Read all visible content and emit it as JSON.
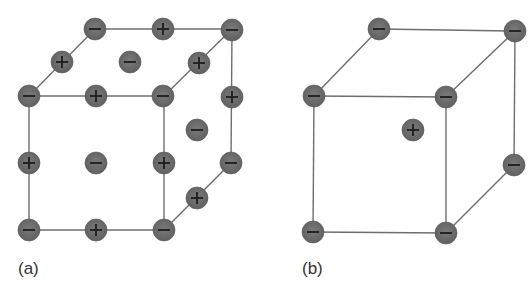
{
  "figure": {
    "panels": [
      {
        "id": "a",
        "label": "(a)",
        "description": "Rock-salt (NaCl-type) cubic unit cell with alternating cations and anions",
        "ions": [
          {
            "position": "top-back-left corner",
            "charge": "-"
          },
          {
            "position": "top-back edge midpoint",
            "charge": "+"
          },
          {
            "position": "top-back-right corner",
            "charge": "-"
          },
          {
            "position": "top-left edge midpoint",
            "charge": "+"
          },
          {
            "position": "top face center",
            "charge": "-"
          },
          {
            "position": "top-right edge midpoint",
            "charge": "+"
          },
          {
            "position": "top-front-left corner",
            "charge": "-"
          },
          {
            "position": "top-front edge midpoint",
            "charge": "+"
          },
          {
            "position": "top-front-right corner",
            "charge": "-"
          },
          {
            "position": "back-right vertical edge midpoint",
            "charge": "+"
          },
          {
            "position": "right face center",
            "charge": "-"
          },
          {
            "position": "front-left vertical edge midpoint",
            "charge": "+"
          },
          {
            "position": "front face center",
            "charge": "-"
          },
          {
            "position": "front-right vertical edge midpoint",
            "charge": "+"
          },
          {
            "position": "bottom-back-right corner",
            "charge": "-"
          },
          {
            "position": "bottom-right edge midpoint",
            "charge": "+"
          },
          {
            "position": "bottom-front-left corner",
            "charge": "-"
          },
          {
            "position": "bottom-front edge midpoint",
            "charge": "+"
          },
          {
            "position": "bottom-front-right corner",
            "charge": "-"
          }
        ]
      },
      {
        "id": "b",
        "label": "(b)",
        "description": "Cesium chloride (CsCl-type) cubic unit cell with body-centered cation",
        "ions": [
          {
            "position": "top-back-left corner",
            "charge": "-"
          },
          {
            "position": "top-back-right corner",
            "charge": "-"
          },
          {
            "position": "top-front-left corner",
            "charge": "-"
          },
          {
            "position": "top-front-right corner",
            "charge": "-"
          },
          {
            "position": "body center",
            "charge": "+"
          },
          {
            "position": "bottom-back-right corner",
            "charge": "-"
          },
          {
            "position": "bottom-front-left corner",
            "charge": "-"
          },
          {
            "position": "bottom-front-right corner",
            "charge": "-"
          }
        ]
      }
    ],
    "colors": {
      "ion_fill": "#6a6a6a",
      "sign": "#1c1c1c",
      "edge": "#6e6e6e",
      "background": "#ffffff"
    }
  }
}
